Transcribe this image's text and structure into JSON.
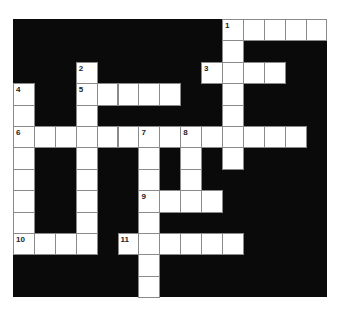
{
  "puzzle": {
    "cols": 15,
    "rows": 13,
    "cell_w": 20.9,
    "cell_h": 21.4,
    "colors": {
      "block": "#0a0a0a",
      "cell": "#ffffff",
      "cell_border": "#8a8a8a",
      "number": "#222222"
    },
    "white_cells": [
      [
        0,
        10
      ],
      [
        0,
        11
      ],
      [
        0,
        12
      ],
      [
        0,
        13
      ],
      [
        0,
        14
      ],
      [
        1,
        10
      ],
      [
        2,
        3
      ],
      [
        2,
        9
      ],
      [
        2,
        10
      ],
      [
        2,
        11
      ],
      [
        2,
        12
      ],
      [
        3,
        0
      ],
      [
        3,
        3
      ],
      [
        3,
        4
      ],
      [
        3,
        5
      ],
      [
        3,
        6
      ],
      [
        3,
        7
      ],
      [
        3,
        10
      ],
      [
        4,
        0
      ],
      [
        4,
        3
      ],
      [
        4,
        10
      ],
      [
        5,
        0
      ],
      [
        5,
        1
      ],
      [
        5,
        2
      ],
      [
        5,
        3
      ],
      [
        5,
        4
      ],
      [
        5,
        5
      ],
      [
        5,
        6
      ],
      [
        5,
        7
      ],
      [
        5,
        8
      ],
      [
        5,
        9
      ],
      [
        5,
        10
      ],
      [
        5,
        11
      ],
      [
        5,
        12
      ],
      [
        5,
        13
      ],
      [
        6,
        0
      ],
      [
        6,
        3
      ],
      [
        6,
        6
      ],
      [
        6,
        8
      ],
      [
        6,
        10
      ],
      [
        7,
        0
      ],
      [
        7,
        3
      ],
      [
        7,
        6
      ],
      [
        7,
        8
      ],
      [
        8,
        0
      ],
      [
        8,
        3
      ],
      [
        8,
        6
      ],
      [
        8,
        7
      ],
      [
        8,
        8
      ],
      [
        8,
        9
      ],
      [
        9,
        0
      ],
      [
        9,
        3
      ],
      [
        9,
        6
      ],
      [
        10,
        0
      ],
      [
        10,
        1
      ],
      [
        10,
        2
      ],
      [
        10,
        3
      ],
      [
        10,
        5
      ],
      [
        10,
        6
      ],
      [
        10,
        7
      ],
      [
        10,
        8
      ],
      [
        10,
        9
      ],
      [
        10,
        10
      ],
      [
        11,
        6
      ],
      [
        12,
        6
      ]
    ],
    "numbers": [
      {
        "row": 0,
        "col": 10,
        "label": "1"
      },
      {
        "row": 2,
        "col": 3,
        "label": "2"
      },
      {
        "row": 2,
        "col": 9,
        "label": "3"
      },
      {
        "row": 3,
        "col": 0,
        "label": "4"
      },
      {
        "row": 3,
        "col": 3,
        "label": "5"
      },
      {
        "row": 5,
        "col": 0,
        "label": "6"
      },
      {
        "row": 5,
        "col": 6,
        "label": "7"
      },
      {
        "row": 5,
        "col": 8,
        "label": "8"
      },
      {
        "row": 8,
        "col": 6,
        "label": "9"
      },
      {
        "row": 10,
        "col": 0,
        "label": "10"
      },
      {
        "row": 10,
        "col": 5,
        "label": "11"
      }
    ]
  }
}
